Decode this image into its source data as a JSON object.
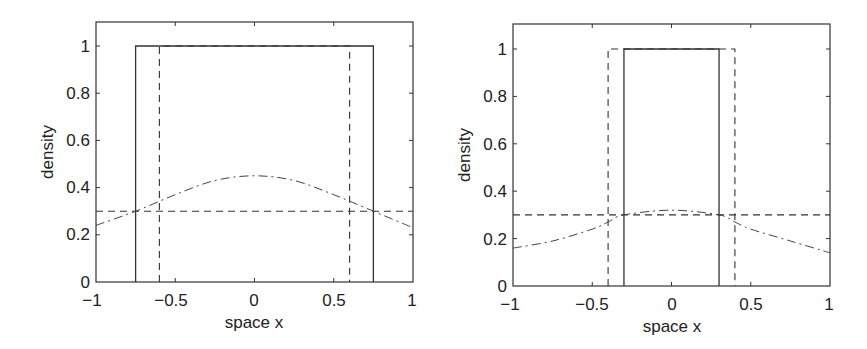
{
  "chart_data": [
    {
      "type": "line",
      "panel": "left",
      "title": "",
      "xlabel": "space x",
      "ylabel": "density",
      "xlim": [
        -1,
        1
      ],
      "ylim": [
        0,
        1.1
      ],
      "grid": false,
      "legend": null,
      "xticks": [
        "-1",
        "-0.5",
        "0",
        "0.5",
        "1"
      ],
      "yticks": [
        "0",
        "0.2",
        "0.4",
        "0.6",
        "0.8",
        "1"
      ],
      "series": [
        {
          "name": "solid box",
          "style": "solid",
          "x": [
            -0.75,
            -0.75,
            0.75,
            0.75
          ],
          "y": [
            0,
            1,
            1,
            0
          ]
        },
        {
          "name": "dashed box",
          "style": "dashed",
          "x": [
            -0.6,
            -0.6,
            0.6,
            0.6
          ],
          "y": [
            0,
            1,
            1,
            0
          ]
        },
        {
          "name": "dashed horizontal",
          "style": "dashed",
          "x": [
            -1,
            1
          ],
          "y": [
            0.3,
            0.3
          ]
        },
        {
          "name": "dash-dot curve",
          "style": "dashdot",
          "x": [
            -1,
            -0.75,
            -0.5,
            -0.25,
            0,
            0.25,
            0.5,
            0.75,
            1
          ],
          "y": [
            0.24,
            0.3,
            0.37,
            0.43,
            0.45,
            0.43,
            0.37,
            0.3,
            0.23
          ]
        }
      ]
    },
    {
      "type": "line",
      "panel": "right",
      "title": "",
      "xlabel": "space x",
      "ylabel": "density",
      "xlim": [
        -1,
        1
      ],
      "ylim": [
        0,
        1.1
      ],
      "grid": false,
      "legend": null,
      "xticks": [
        "-1",
        "-0.5",
        "0",
        "0.5",
        "1"
      ],
      "yticks": [
        "0",
        "0.2",
        "0.4",
        "0.6",
        "0.8",
        "1"
      ],
      "series": [
        {
          "name": "solid box",
          "style": "solid",
          "x": [
            -0.3,
            -0.3,
            0.3,
            0.3
          ],
          "y": [
            0,
            1,
            1,
            0
          ]
        },
        {
          "name": "dashed box",
          "style": "dashed",
          "x": [
            -0.4,
            -0.4,
            0.4,
            0.4
          ],
          "y": [
            0,
            1,
            1,
            0
          ]
        },
        {
          "name": "dashed horizontal",
          "style": "dashed",
          "x": [
            -1,
            1
          ],
          "y": [
            0.3,
            0.3
          ]
        },
        {
          "name": "dash-dot curve",
          "style": "dashdot",
          "x": [
            -1,
            -0.75,
            -0.5,
            -0.4,
            -0.3,
            0,
            0.3,
            0.4,
            0.5,
            0.75,
            1
          ],
          "y": [
            0.16,
            0.19,
            0.24,
            0.27,
            0.3,
            0.32,
            0.3,
            0.27,
            0.24,
            0.19,
            0.14
          ]
        }
      ]
    }
  ],
  "panels": [
    {
      "xlabel": "space x",
      "ylabel": "density",
      "xticks": [
        "−1",
        "−0.5",
        "0",
        "0.5",
        "1"
      ],
      "yticks": [
        "0",
        "0.2",
        "0.4",
        "0.6",
        "0.8",
        "1"
      ]
    },
    {
      "xlabel": "space x",
      "ylabel": "density",
      "xticks": [
        "−1",
        "−0.5",
        "0",
        "0.5",
        "1"
      ],
      "yticks": [
        "0",
        "0.2",
        "0.4",
        "0.6",
        "0.8",
        "1"
      ]
    }
  ]
}
